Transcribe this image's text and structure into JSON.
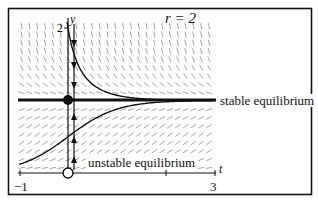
{
  "figure": {
    "parameter_label": "r = 2",
    "axis_y_label": "y",
    "axis_t_label": "t",
    "y_tick_top": "2",
    "t_tick_left": "−1",
    "t_tick_right": "3",
    "stable_label": "stable equilibrium",
    "unstable_label": "unstable equilibrium"
  },
  "colors": {
    "ink": "#111111",
    "field": "#9a9a9a",
    "background": "#ffffff"
  },
  "chart_data": {
    "type": "line",
    "title": "r = 2",
    "xlabel": "t",
    "ylabel": "y",
    "xlim": [
      -1,
      3
    ],
    "ylim": [
      0,
      2
    ],
    "equation": "y' = r y (1 - y), r = 2",
    "equilibria": [
      {
        "y": 1,
        "kind": "stable equilibrium",
        "marker": "filled circle"
      },
      {
        "y": 0,
        "kind": "unstable equilibrium",
        "marker": "open circle"
      }
    ],
    "series": [
      {
        "name": "solution above",
        "x": [
          -0.05,
          0,
          0.25,
          0.5,
          1,
          1.5,
          2,
          3
        ],
        "y": [
          2.2,
          2.0,
          1.45,
          1.2,
          1.04,
          1.01,
          1.0,
          1.0
        ]
      },
      {
        "name": "solution below",
        "x": [
          -1,
          -0.5,
          0,
          0.5,
          1,
          1.5,
          2,
          3
        ],
        "y": [
          0.12,
          0.27,
          0.5,
          0.73,
          0.88,
          0.95,
          0.98,
          1.0
        ]
      }
    ],
    "phase_line": {
      "t": 0,
      "arrows": [
        "down above y=1",
        "up between 0 and 1"
      ]
    },
    "grid": false,
    "direction_field": true
  }
}
